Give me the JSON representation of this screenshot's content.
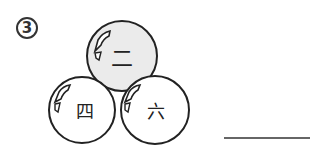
{
  "problem": {
    "number": "3"
  },
  "balls": [
    {
      "label": "二",
      "shade": "#ebebeb"
    },
    {
      "label": "四",
      "shade": "#ffffff"
    },
    {
      "label": "六",
      "shade": "#ffffff"
    }
  ],
  "answer": {
    "value": ""
  }
}
